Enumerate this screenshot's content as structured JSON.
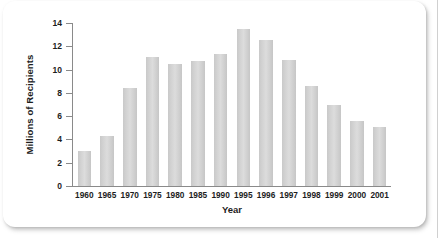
{
  "chart_data": {
    "type": "bar",
    "title": "",
    "xlabel": "Year",
    "ylabel": "Millions of Recipients",
    "categories": [
      "1960",
      "1965",
      "1970",
      "1975",
      "1980",
      "1985",
      "1990",
      "1995",
      "1996",
      "1997",
      "1998",
      "1999",
      "2000",
      "2001"
    ],
    "values": [
      3.0,
      4.3,
      8.4,
      11.1,
      10.5,
      10.7,
      11.3,
      13.5,
      12.5,
      10.8,
      8.6,
      7.0,
      5.6,
      5.1
    ],
    "ylim": [
      0,
      14
    ],
    "yticks": [
      "0",
      "2",
      "4",
      "6",
      "8",
      "10",
      "12",
      "14"
    ],
    "ytick_values": [
      0,
      2,
      4,
      6,
      8,
      10,
      12,
      14
    ],
    "grid": false,
    "legend": false,
    "bar_color": "#d2d2d2",
    "axis_color": "#8a8a8a",
    "text_color": "#1d1d1d"
  }
}
